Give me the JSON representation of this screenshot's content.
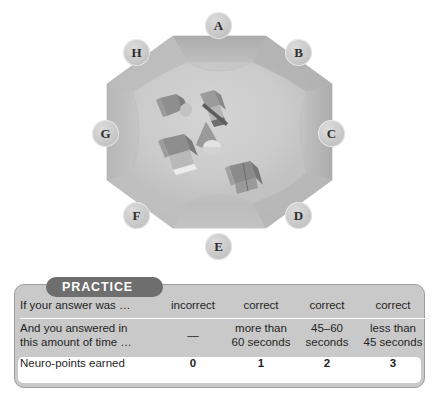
{
  "arena": {
    "title": "octagonal-arena",
    "position_badges": [
      {
        "letter": "A",
        "x": 205,
        "y": 12
      },
      {
        "letter": "B",
        "x": 285,
        "y": 39
      },
      {
        "letter": "C",
        "x": 318,
        "y": 120
      },
      {
        "letter": "D",
        "x": 285,
        "y": 202
      },
      {
        "letter": "E",
        "x": 205,
        "y": 233
      },
      {
        "letter": "F",
        "x": 123,
        "y": 202
      },
      {
        "letter": "G",
        "x": 92,
        "y": 120
      },
      {
        "letter": "H",
        "x": 123,
        "y": 39
      }
    ],
    "objects": [
      {
        "name": "cylinder-object"
      },
      {
        "name": "wedge-object"
      },
      {
        "name": "cone-object"
      },
      {
        "name": "block-object"
      },
      {
        "name": "cube-object"
      }
    ],
    "colors": {
      "outer_ring": "#b4b4b4",
      "floor": "#c0c0c0",
      "inner_floor": "#c9c9c9",
      "badge": "#c9c9c9"
    }
  },
  "practice": {
    "tab_label": "PRACTICE",
    "accent_color": "#6e6e6e",
    "panel_color": "#c9c9c9",
    "rows": [
      {
        "label": "If your answer was …",
        "values": [
          "incorrect",
          "correct",
          "correct",
          "correct"
        ]
      },
      {
        "label": "And you answered in\nthis amount of time …",
        "label_line1": "And you answered in",
        "label_line2": "this amount of time …",
        "values": [
          "—",
          "more than\n60 seconds",
          "45–60\nseconds",
          "less than\n45 seconds"
        ],
        "values_line1": [
          "—",
          "more than",
          "45–60",
          "less than"
        ],
        "values_line2": [
          "",
          "60 seconds",
          "seconds",
          "45 seconds"
        ]
      },
      {
        "label": "Neuro-points earned",
        "values": [
          "0",
          "1",
          "2",
          "3"
        ]
      }
    ]
  }
}
